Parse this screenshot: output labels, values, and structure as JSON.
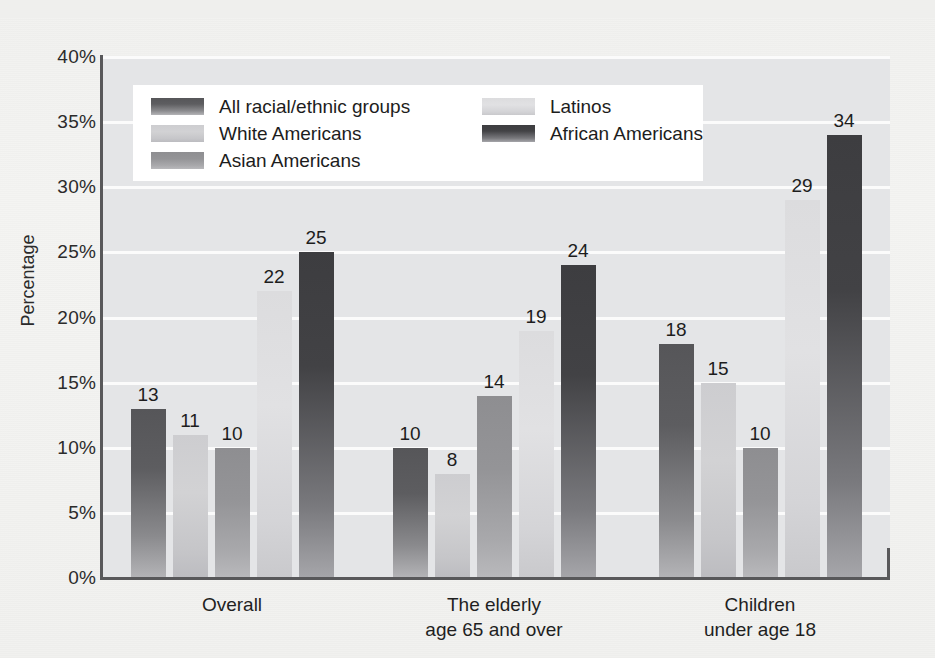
{
  "chart_data": {
    "type": "bar",
    "title": "",
    "xlabel": "",
    "ylabel": "Percentage",
    "ylim": [
      0,
      40
    ],
    "ytick_labels": [
      "0%",
      "5%",
      "10%",
      "15%",
      "20%",
      "25%",
      "30%",
      "35%",
      "40%"
    ],
    "ytick_values": [
      0,
      5,
      10,
      15,
      20,
      25,
      30,
      35,
      40
    ],
    "grid": true,
    "grid_axis": "y",
    "legend_position": "upper-left-inside",
    "categories": [
      "Overall",
      "The elderly\nage 65 and over",
      "Children\nunder age 18"
    ],
    "series": [
      {
        "name": "All racial/ethnic groups",
        "color": "#565659",
        "values": [
          13,
          10,
          18
        ]
      },
      {
        "name": "White Americans",
        "color": "#cdcdd0",
        "values": [
          11,
          8,
          15
        ]
      },
      {
        "name": "Asian Americans",
        "color": "#8e8e91",
        "values": [
          10,
          14,
          10
        ]
      },
      {
        "name": "Latinos",
        "color": "#dcdcde",
        "values": [
          22,
          19,
          29
        ]
      },
      {
        "name": "African Americans",
        "color": "#3d3d40",
        "values": [
          25,
          24,
          34
        ]
      }
    ],
    "value_labels": [
      [
        "13",
        "11",
        "10",
        "22",
        "25"
      ],
      [
        "10",
        "8",
        "14",
        "19",
        "24"
      ],
      [
        "18",
        "15",
        "10",
        "29",
        "34"
      ]
    ],
    "colors": {
      "plot_background": "#e4e5e7",
      "page_background": "#f1f1ef",
      "gridline": "#fbfbfb",
      "axis": "#58585a",
      "text": "#1d1d1d",
      "legend_background": "#ffffff"
    }
  },
  "legend": {
    "columns": [
      {
        "items": [
          {
            "label": "All racial/ethnic groups",
            "series": 0
          },
          {
            "label": "White Americans",
            "series": 1
          },
          {
            "label": "Asian Americans",
            "series": 2
          }
        ]
      },
      {
        "items": [
          {
            "label": "Latinos",
            "series": 3
          },
          {
            "label": "African Americans",
            "series": 4
          }
        ]
      }
    ]
  },
  "axes": {
    "y_title": "Percentage",
    "y_ticks": [
      "40%",
      "35%",
      "30%",
      "25%",
      "20%",
      "15%",
      "10%",
      "5%",
      "0%"
    ],
    "x_labels": [
      "Overall",
      "The elderly\nage 65 and over",
      "Children\nunder age 18"
    ]
  }
}
